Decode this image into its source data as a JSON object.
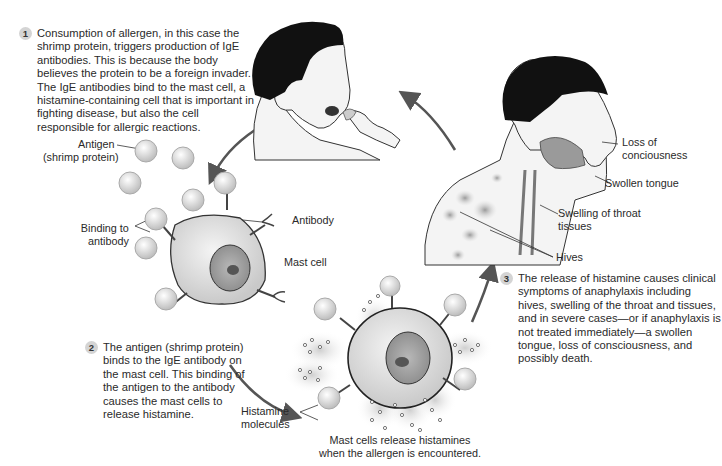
{
  "steps": [
    {
      "number": "1",
      "text": "Consumption of allergen, in this case the shrimp protein, triggers production of IgE antibodies. This is because the body believes the protein to be a foreign invader. The IgE antibodies bind to the mast cell, a histamine-containing cell that is important in fighting disease, but also the cell responsible for allergic reactions."
    },
    {
      "number": "2",
      "text": "The antigen (shrimp protein) binds to the IgE antibody on the mast cell. This binding of the antigen to the antibody causes the mast cells to release histamine."
    },
    {
      "number": "3",
      "text": "The release of histamine causes clinical symptoms of anaphylaxis including hives, swelling of the throat and tissues, and in severe cases—or if anaphylaxis is not treated immediately—a swollen tongue, loss of consciousness, and possibly death."
    }
  ],
  "labels": {
    "antigen": "Antigen",
    "antigen_sub": "(shrimp protein)",
    "binding": "Binding to",
    "binding_sub": "antibody",
    "antibody": "Antibody",
    "mast_cell": "Mast cell",
    "histamine": "Histamine",
    "histamine_sub": "molecules",
    "loss_consciousness": "Loss of",
    "loss_consciousness_sub": "conciousness",
    "swollen_tongue": "Swollen tongue",
    "throat": "Swelling of throat",
    "throat_sub": "tissues",
    "hives": "Hives"
  },
  "caption": {
    "line1": "Mast cells release histamines",
    "line2": "when the allergen is encountered."
  },
  "colors": {
    "step_badge": "#d4d4d4",
    "arrow": "#555555",
    "hair": "#111111",
    "skin": "#f2f2f2"
  }
}
